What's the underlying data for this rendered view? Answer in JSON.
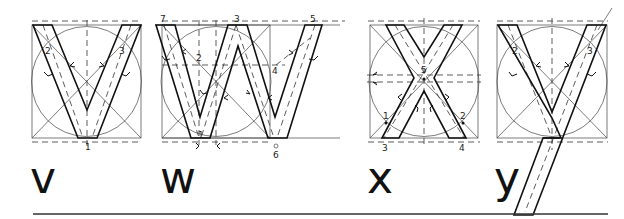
{
  "figure": {
    "letters": [
      {
        "id": "v",
        "glyph": "v",
        "point_labels": [
          "1",
          "2",
          "3"
        ]
      },
      {
        "id": "w",
        "glyph": "w",
        "point_labels": [
          "1",
          "2",
          "3",
          "4",
          "5",
          "6",
          "7"
        ]
      },
      {
        "id": "x",
        "glyph": "x",
        "point_labels": [
          "1",
          "2",
          "3",
          "4",
          "5"
        ]
      },
      {
        "id": "y",
        "glyph": "y",
        "point_labels": [
          "2",
          "3"
        ]
      }
    ]
  },
  "labels": {
    "v": {
      "p1": "1",
      "p2": "2",
      "p3": "3"
    },
    "w": {
      "p1": "1",
      "p2": "2",
      "p3": "3",
      "p4": "4",
      "p5": "5",
      "p6": "6",
      "p7": "7"
    },
    "x": {
      "p1": "1",
      "p2": "2",
      "p3": "3",
      "p4": "4",
      "p5": "5"
    },
    "y": {
      "p2": "2",
      "p3": "3"
    }
  },
  "glyphs": {
    "v": "v",
    "w": "w",
    "x": "x",
    "y": "y"
  },
  "colors": {
    "ink": "#111111",
    "guide": "#444444",
    "background": "#ffffff"
  }
}
